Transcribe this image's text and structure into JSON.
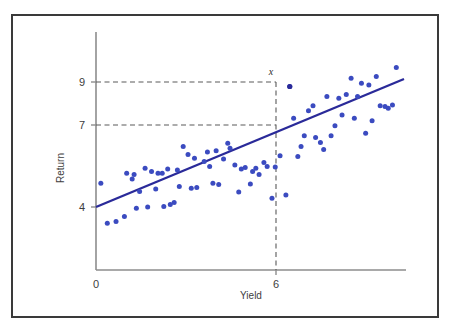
{
  "figure": {
    "frame_color": "#3a3a3a",
    "background": "#ffffff"
  },
  "chart_data": {
    "type": "scatter",
    "title": "",
    "xlabel": "Yield",
    "ylabel": "Return",
    "xlim": [
      0,
      9.6
    ],
    "ylim": [
      2.2,
      11.2
    ],
    "xticks": [
      0,
      6
    ],
    "xtick_labels": [
      "0",
      "6"
    ],
    "yticks": [
      4,
      7,
      9
    ],
    "ytick_labels": [
      "4",
      "7",
      "9"
    ],
    "grid": false,
    "legend": null,
    "point_color": "#3b4bc0",
    "line_color": "#2a2a99",
    "guide_color": "#555555",
    "annotations": [
      {
        "label": "x",
        "x": 6,
        "y": 9,
        "style": "italic",
        "description": "marked point on vertical guide at Yield = 6"
      }
    ],
    "guides": [
      {
        "type": "horizontal-dashed",
        "y": 9,
        "from_x": 0,
        "to_x": 6
      },
      {
        "type": "horizontal-dashed",
        "y": 7,
        "from_x": 0,
        "to_x": 6
      },
      {
        "type": "vertical-dashed",
        "x": 6,
        "from_y": 2.2,
        "to_y": 9
      }
    ],
    "fit_line": {
      "type": "linear",
      "x_start": 0,
      "y_start": 4.0,
      "x_end": 9.3,
      "y_end": 8.95,
      "slope": 0.532,
      "intercept": 4.0
    },
    "points": [
      [
        0.15,
        4.95
      ],
      [
        0.35,
        3.35
      ],
      [
        0.62,
        3.42
      ],
      [
        0.88,
        3.62
      ],
      [
        0.95,
        5.35
      ],
      [
        1.12,
        5.12
      ],
      [
        1.18,
        5.3
      ],
      [
        1.25,
        3.95
      ],
      [
        1.35,
        4.62
      ],
      [
        1.52,
        5.55
      ],
      [
        1.6,
        4.0
      ],
      [
        1.72,
        5.42
      ],
      [
        1.85,
        4.72
      ],
      [
        1.92,
        5.35
      ],
      [
        2.05,
        5.35
      ],
      [
        2.1,
        4.02
      ],
      [
        2.3,
        4.1
      ],
      [
        2.42,
        4.18
      ],
      [
        2.52,
        5.48
      ],
      [
        2.58,
        4.82
      ],
      [
        2.7,
        6.42
      ],
      [
        2.85,
        6.1
      ],
      [
        2.95,
        4.75
      ],
      [
        3.05,
        5.95
      ],
      [
        3.12,
        4.78
      ],
      [
        3.35,
        5.82
      ],
      [
        3.45,
        6.2
      ],
      [
        3.52,
        5.62
      ],
      [
        3.72,
        6.25
      ],
      [
        3.8,
        4.9
      ],
      [
        3.95,
        5.92
      ],
      [
        4.08,
        6.55
      ],
      [
        4.15,
        6.35
      ],
      [
        4.3,
        5.68
      ],
      [
        4.42,
        4.6
      ],
      [
        4.5,
        5.52
      ],
      [
        4.62,
        5.58
      ],
      [
        4.78,
        4.92
      ],
      [
        4.85,
        5.42
      ],
      [
        4.95,
        5.55
      ],
      [
        5.05,
        5.3
      ],
      [
        5.2,
        5.78
      ],
      [
        5.45,
        4.35
      ],
      [
        5.55,
        5.6
      ],
      [
        5.7,
        6.05
      ],
      [
        5.88,
        4.48
      ],
      [
        6.0,
        8.82
      ],
      [
        6.12,
        7.55
      ],
      [
        6.25,
        6.02
      ],
      [
        6.35,
        6.42
      ],
      [
        6.45,
        6.85
      ],
      [
        6.58,
        7.85
      ],
      [
        6.72,
        8.05
      ],
      [
        6.8,
        6.78
      ],
      [
        6.95,
        6.58
      ],
      [
        7.05,
        6.3
      ],
      [
        7.15,
        8.42
      ],
      [
        7.28,
        6.85
      ],
      [
        7.4,
        7.25
      ],
      [
        7.52,
        8.35
      ],
      [
        7.62,
        7.68
      ],
      [
        7.75,
        8.5
      ],
      [
        7.9,
        9.15
      ],
      [
        8.0,
        7.55
      ],
      [
        8.1,
        8.42
      ],
      [
        8.22,
        8.95
      ],
      [
        8.35,
        6.95
      ],
      [
        8.45,
        8.88
      ],
      [
        8.55,
        7.45
      ],
      [
        8.68,
        9.22
      ],
      [
        8.8,
        8.05
      ],
      [
        8.95,
        8.02
      ],
      [
        9.05,
        7.95
      ],
      [
        9.18,
        8.08
      ],
      [
        9.3,
        9.58
      ],
      [
        3.62,
        4.95
      ],
      [
        5.3,
        5.62
      ],
      [
        2.22,
        5.52
      ]
    ]
  },
  "axes": {
    "y_axis_label": "Return",
    "x_axis_label": "Yield",
    "origin_label": "0",
    "x_marker_label": "x"
  }
}
